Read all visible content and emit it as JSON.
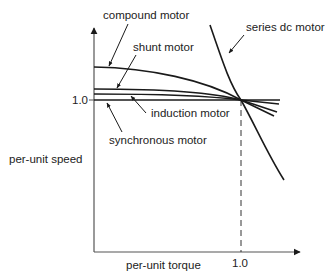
{
  "diagram": {
    "x_axis": {
      "label": "per-unit torque",
      "tick": "1.0"
    },
    "y_axis": {
      "label": "per-unit speed",
      "tick": "1.0"
    },
    "curves": [
      {
        "id": "compound",
        "label": "compound motor"
      },
      {
        "id": "shunt",
        "label": "shunt motor"
      },
      {
        "id": "induction",
        "label": "induction motor"
      },
      {
        "id": "synchronous",
        "label": "synchronous motor"
      },
      {
        "id": "series-dc",
        "label": "series dc motor"
      }
    ],
    "colors": {
      "line": "#1a1a1a",
      "axis": "#444444",
      "background": "#ffffff"
    }
  }
}
